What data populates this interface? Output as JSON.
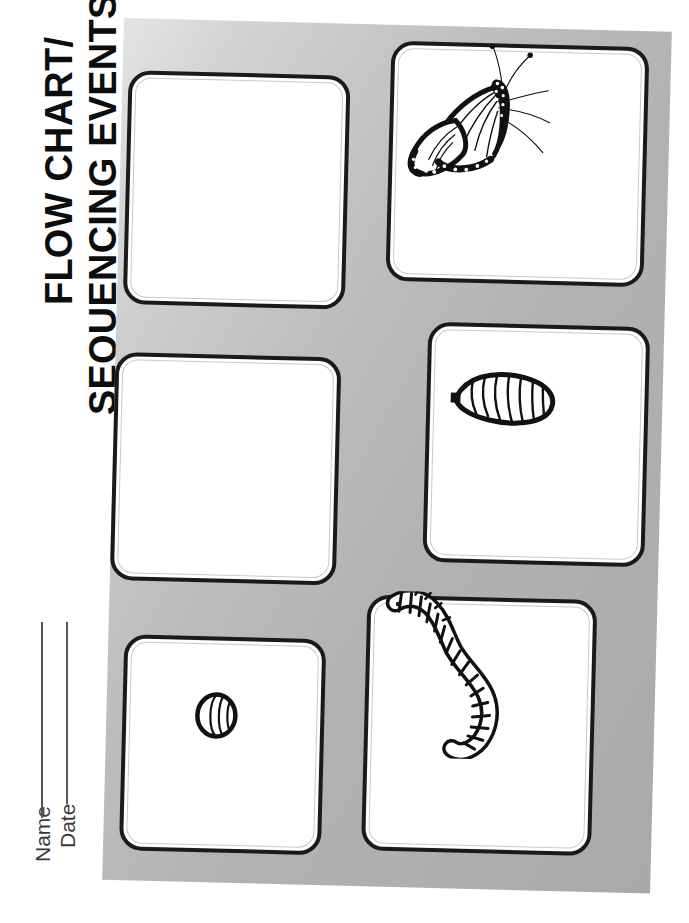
{
  "worksheet": {
    "title_line_1": "FLOW CHART/",
    "title_line_2": "SEQUENCING EVENTS",
    "orientation": "title-rotated-90-ccw",
    "background": {
      "page_color": "#ffffff",
      "panel_gradient_from": "#e4e4e4",
      "panel_gradient_to": "#a9a9a9",
      "panel_rotation_deg": 1.45
    },
    "fields": [
      {
        "label": "Name",
        "value": "",
        "has_rule": true
      },
      {
        "label": "Date",
        "value": "",
        "has_rule": true
      }
    ],
    "boxes": [
      {
        "id": "box-1",
        "label": "",
        "position": "top-left",
        "sequence": 1
      },
      {
        "id": "box-2",
        "label": "",
        "position": "top-right",
        "sequence": 2
      },
      {
        "id": "box-3",
        "label": "",
        "position": "middle-left",
        "sequence": 3
      },
      {
        "id": "box-4",
        "label": "",
        "position": "middle-right",
        "sequence": 4
      },
      {
        "id": "box-5",
        "label": "",
        "position": "bottom-left",
        "sequence": 5
      },
      {
        "id": "box-6",
        "label": "",
        "position": "bottom-right",
        "sequence": 6
      }
    ],
    "illustrations": [
      {
        "id": "butterfly",
        "name": "monarch-butterfly",
        "stage": "adult butterfly"
      },
      {
        "id": "chrysalis",
        "name": "chrysalis",
        "stage": "pupa / chrysalis"
      },
      {
        "id": "caterpillar",
        "name": "caterpillar",
        "stage": "larva / caterpillar"
      },
      {
        "id": "egg",
        "name": "egg",
        "stage": "egg"
      }
    ],
    "box_style": {
      "outer_border_color": "#1a1a1a",
      "inner_border_color": "#c9c9c9",
      "fill_color": "#ffffff"
    }
  }
}
